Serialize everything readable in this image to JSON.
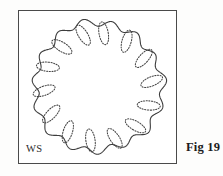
{
  "figure": {
    "caption": "Fig 19",
    "specimen_label": "WS",
    "diagram_type": "botanical-cross-section"
  },
  "colors": {
    "background": "#fdfdfc",
    "panel_background": "#ffffff",
    "frame_stroke": "#4a4a4a",
    "outline_stroke": "#3d3d3d",
    "bundle_stroke": "#444444",
    "caption_text": "#1c1c1c",
    "label_text": "#2b2b2b"
  },
  "geometry": {
    "frame": {
      "x": 18,
      "y": 10,
      "width": 159,
      "height": 154
    },
    "center": {
      "x": 79,
      "y": 76
    },
    "outline": {
      "lobe_count": 15,
      "mean_radius": 64,
      "lobe_amplitude": 3.4,
      "phase_deg": -6,
      "wobble_amplitude": 1.3,
      "wobble_periods": 3
    },
    "bundles": {
      "count": 14,
      "ring_radius": 54,
      "semi_major": 11.5,
      "semi_minor": 4.6,
      "tangential_tilt_deg": 74,
      "start_angle_deg": -84
    }
  },
  "chart_data": {
    "type": "scatter",
    "title": "Fig 19",
    "xlabel": "",
    "ylabel": "",
    "annotations": [
      "WS",
      "Fig 19"
    ],
    "categories": [
      "bundle-1",
      "bundle-2",
      "bundle-3",
      "bundle-4",
      "bundle-5",
      "bundle-6",
      "bundle-7",
      "bundle-8",
      "bundle-9",
      "bundle-10",
      "bundle-11",
      "bundle-12",
      "bundle-13",
      "bundle-14"
    ],
    "values": [
      {
        "angle_deg": -84,
        "radius": 54
      },
      {
        "angle_deg": -58,
        "radius": 54
      },
      {
        "angle_deg": -32,
        "radius": 54
      },
      {
        "angle_deg": -6,
        "radius": 54
      },
      {
        "angle_deg": 20,
        "radius": 54
      },
      {
        "angle_deg": 46,
        "radius": 54
      },
      {
        "angle_deg": 72,
        "radius": 54
      },
      {
        "angle_deg": 98,
        "radius": 54
      },
      {
        "angle_deg": 124,
        "radius": 54
      },
      {
        "angle_deg": 150,
        "radius": 54
      },
      {
        "angle_deg": 176,
        "radius": 54
      },
      {
        "angle_deg": 202,
        "radius": 54
      },
      {
        "angle_deg": 228,
        "radius": 54
      },
      {
        "angle_deg": 254,
        "radius": 54
      }
    ]
  }
}
